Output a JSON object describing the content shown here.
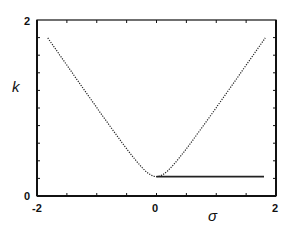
{
  "chart_data": {
    "type": "line",
    "title": "",
    "xlabel": "σ",
    "ylabel": "k",
    "xlim": [
      -2,
      2
    ],
    "ylim": [
      0,
      2
    ],
    "grid": false,
    "legend": null,
    "x_tick_labels": [
      "-2",
      "0",
      "2"
    ],
    "y_tick_labels": [
      "0",
      "2"
    ],
    "series": [
      {
        "name": "dispersion curve",
        "style": "dotted",
        "x": [
          -1.82,
          -1.5,
          -1.0,
          -0.5,
          -0.25,
          0.0,
          0.25,
          0.5,
          1.0,
          1.5,
          1.82
        ],
        "y": [
          1.82,
          1.52,
          1.03,
          0.56,
          0.34,
          0.22,
          0.34,
          0.56,
          1.03,
          1.52,
          1.83
        ]
      },
      {
        "name": "flat branch",
        "style": "solid",
        "x": [
          0.0,
          1.8
        ],
        "y": [
          0.22,
          0.22
        ]
      }
    ]
  },
  "axes": {
    "x_label": "σ",
    "y_label": "k",
    "x_ticks": {
      "left": "-2",
      "mid": "0",
      "right": "2"
    },
    "y_ticks": {
      "bottom": "0",
      "top": "2"
    }
  }
}
